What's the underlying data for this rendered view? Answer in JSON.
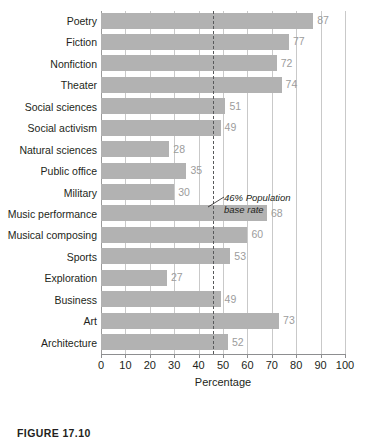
{
  "chart_data": {
    "type": "bar",
    "orientation": "horizontal",
    "title": "",
    "xlabel": "Percentage",
    "ylabel": "",
    "xlim": [
      0,
      100
    ],
    "xticks": [
      0,
      10,
      20,
      30,
      40,
      50,
      60,
      70,
      80,
      90,
      100
    ],
    "grid": "vertical",
    "legend": "none",
    "categories": [
      "Poetry",
      "Fiction",
      "Nonfiction",
      "Theater",
      "Social sciences",
      "Social activism",
      "Natural sciences",
      "Public office",
      "Military",
      "Music performance",
      "Musical composing",
      "Sports",
      "Exploration",
      "Business",
      "Art",
      "Architecture"
    ],
    "values": [
      87,
      77,
      72,
      74,
      51,
      49,
      28,
      35,
      30,
      68,
      60,
      53,
      27,
      49,
      73,
      52
    ],
    "reference_line": {
      "value": 46,
      "style": "dashed",
      "label_line_1": "46% Population",
      "label_line_2": "base rate"
    },
    "colors": {
      "bar": "#b2b2b2",
      "value_label": "#9c9c9c",
      "grid": "#c9c9c9",
      "axis": "#8d8e90",
      "text": "#231f20"
    }
  },
  "caption": {
    "text": "FIGURE 17.10"
  }
}
